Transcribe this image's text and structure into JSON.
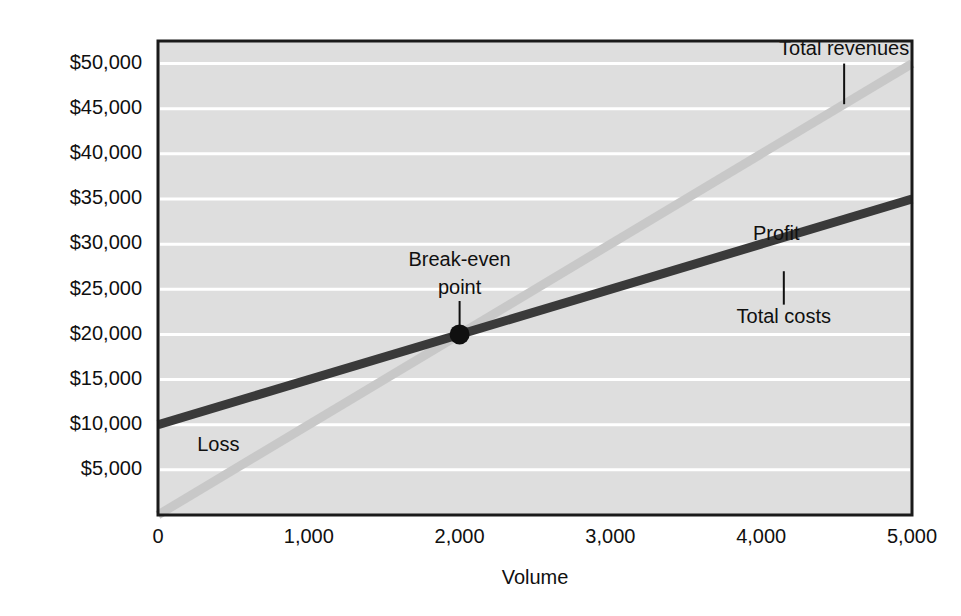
{
  "chart_data": {
    "type": "line",
    "title": "",
    "subtitle": "",
    "xlabel": "Volume",
    "ylabel": "",
    "xlim": [
      0,
      5000
    ],
    "ylim": [
      0,
      52500
    ],
    "grid": true,
    "grid_axis": "y",
    "legend_position": "none",
    "x_ticks": [
      "0",
      "1,000",
      "2,000",
      "3,000",
      "4,000",
      "5,000"
    ],
    "x_tick_values": [
      0,
      1000,
      2000,
      3000,
      4000,
      5000
    ],
    "y_ticks": [
      "$5,000",
      "$10,000",
      "$15,000",
      "$20,000",
      "$25,000",
      "$30,000",
      "$35,000",
      "$40,000",
      "$45,000",
      "$50,000"
    ],
    "y_tick_values": [
      5000,
      10000,
      15000,
      20000,
      25000,
      30000,
      35000,
      40000,
      45000,
      50000
    ],
    "series": [
      {
        "name": "Total revenues",
        "color": "#c8c8c8",
        "width": 9,
        "x": [
          0,
          5000
        ],
        "values": [
          0,
          50000
        ]
      },
      {
        "name": "Total costs",
        "color": "#3a3a3a",
        "width": 9,
        "x": [
          0,
          5000
        ],
        "values": [
          10000,
          35000
        ]
      }
    ],
    "annotations": [
      {
        "name": "total-revenues",
        "text": "Total revenues",
        "x": 4550,
        "y": 51500,
        "anchor": "middle",
        "leader": {
          "x": 4550,
          "y_from": 50000,
          "y_to": 45500
        }
      },
      {
        "name": "profit",
        "text": "Profit",
        "x": 4100,
        "y": 31000,
        "anchor": "middle",
        "leader": null
      },
      {
        "name": "total-costs",
        "text": "Total costs",
        "x": 4150,
        "y": 21800,
        "anchor": "middle",
        "leader": {
          "x": 4150,
          "y_from": 27000,
          "y_to": 23300
        }
      },
      {
        "name": "break-even-point-line1",
        "text": "Break-even",
        "x": 2000,
        "y": 28200,
        "anchor": "middle",
        "leader": null
      },
      {
        "name": "break-even-point-line2",
        "text": "point",
        "x": 2000,
        "y": 25100,
        "anchor": "middle",
        "leader": {
          "x": 2000,
          "y_from": 23700,
          "y_to": 20700
        }
      },
      {
        "name": "loss",
        "text": "Loss",
        "x": 260,
        "y": 7700,
        "anchor": "start",
        "leader": null
      }
    ],
    "markers": [
      {
        "name": "break-even-point",
        "x": 2000,
        "y": 20000,
        "radius": 10,
        "color": "#101010",
        "label": "Break-even point"
      }
    ],
    "colors": {
      "plot_background": "#dedede",
      "plot_border": "#1a1a1a",
      "gridline": "#ffffff",
      "page_background": "#ffffff",
      "text": "#101010",
      "total_revenues_line": "#c8c8c8",
      "total_costs_line": "#3a3a3a",
      "break_even_marker": "#101010"
    }
  }
}
